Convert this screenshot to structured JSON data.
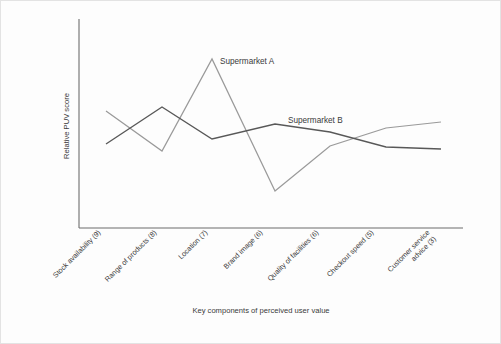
{
  "chart_data": {
    "type": "line",
    "title": "",
    "subtitle": "",
    "xlabel": "Key components of perceived user value",
    "ylabel": "Relative PUV score",
    "grid": false,
    "legend_position": "inline-annotation",
    "axis_style": "two-axis-lines-no-ticks",
    "categories": [
      "Stock availability (9)",
      "Range of products (8)",
      "Location (7)",
      "Brand image (6)",
      "Quality of facilities (6)",
      "Checkout speed (5)",
      "Customer service advice (3)"
    ],
    "category_lines": [
      [
        "Stock availability (9)"
      ],
      [
        "Range of products (8)"
      ],
      [
        "Location (7)"
      ],
      [
        "Brand image (6)"
      ],
      [
        "Quality of facilities (6)"
      ],
      [
        "Checkout speed (5)"
      ],
      [
        "Customer service",
        "advice (3)"
      ]
    ],
    "xlim": [
      0,
      6
    ],
    "ylim": [
      0,
      10
    ],
    "series": [
      {
        "name": "Supermarket A",
        "color": "#9a9a9a",
        "values": [
          7.0,
          4.6,
          9.8,
          2.2,
          5.0,
          6.3,
          6.6
        ]
      },
      {
        "name": "Supermarket B",
        "color": "#585858",
        "values": [
          5.0,
          6.8,
          5.6,
          6.4,
          6.1,
          5.1,
          5.0
        ]
      }
    ],
    "annotations": [
      {
        "text": "Supermarket A",
        "series": "Supermarket A",
        "near_category": "Location (7)"
      },
      {
        "text": "Supermarket B",
        "series": "Supermarket B",
        "near_category": "Brand image (6)"
      }
    ]
  },
  "geometry": {
    "axis_x": 78,
    "axis_y_top": 18,
    "axis_y_baseline": 227,
    "axis_x_right": 462,
    "category_x": [
      105,
      161,
      211,
      274,
      329,
      385,
      440
    ],
    "series_a_y": [
      110,
      150,
      58,
      190,
      145,
      127,
      121
    ],
    "series_b_y": [
      143,
      106,
      138,
      123,
      131,
      146,
      148
    ],
    "label_a": {
      "x": 219,
      "y": 63
    },
    "label_b": {
      "x": 287,
      "y": 122
    },
    "ylabel_anchor": {
      "x": 68,
      "y": 125
    },
    "xlabel_anchor": {
      "x": 260,
      "y": 312
    },
    "cat_label_rotation": -45,
    "cat_label_start": [
      {
        "x": 100,
        "y": 232
      },
      {
        "x": 156,
        "y": 232
      },
      {
        "x": 207,
        "y": 232
      },
      {
        "x": 262,
        "y": 232
      },
      {
        "x": 318,
        "y": 232
      },
      {
        "x": 373,
        "y": 232
      },
      {
        "x": 429,
        "y": 232
      }
    ]
  },
  "colors": {
    "series_a": "#9a9a9a",
    "series_b": "#585858",
    "axis": "#6d6d6d",
    "text": "#3a3a3a",
    "background": "#fdfdfd",
    "frame": "#e3e3e3"
  }
}
